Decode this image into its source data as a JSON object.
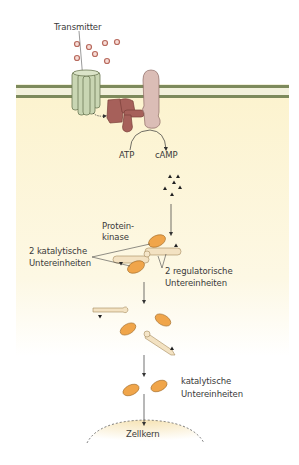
{
  "diagram": {
    "labels": {
      "transmitter": "Transmitter",
      "atp": "ATP",
      "camp": "cAMP",
      "protein": "Protein-",
      "kinase": "kinase",
      "catalytic_count": "2 katalytische",
      "catalytic_unit": "Untereinheiten",
      "regulatory_count": "2 regulatorische",
      "regulatory_unit": "Untereinheiten",
      "catalytic_free": "katalytische",
      "catalytic_free_unit": "Untereinheiten",
      "nucleus": "Zellkern"
    },
    "colors": {
      "cytoplasm": "#fdf6d8",
      "membrane": "#8a8a5a",
      "receptor": "#c6d3b0",
      "g_protein": "#a8625a",
      "adenylyl_cyclase": "#dbbcb6",
      "catalytic_subunit": "#f0a64a",
      "regulatory_subunit": "#f3e3c4",
      "transmitter_dot": "#c47a6a"
    }
  }
}
